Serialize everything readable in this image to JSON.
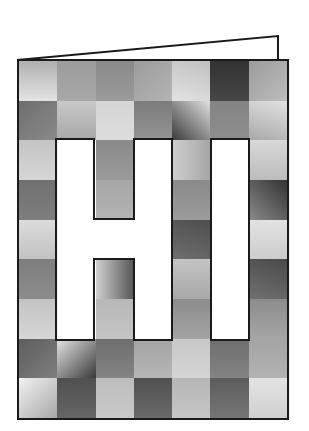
{
  "card": {
    "title": "HI",
    "letters": [
      "H",
      "I"
    ],
    "border_color": "#1a1a1a",
    "grid": {
      "columns": 7,
      "rows": 9
    },
    "tiles": [
      [
        [
          "#b0b0b0",
          "#e4e4e4",
          "180deg"
        ],
        [
          "#9c9c9c",
          "#a8a8a8",
          "180deg"
        ],
        [
          "#8a8a8a",
          "#9a9a9a",
          "180deg"
        ],
        [
          "#9c9c9c",
          "#b4b4b4",
          "135deg"
        ],
        [
          "#c0c0c0",
          "#e2e2e2",
          "200deg"
        ],
        [
          "#333333",
          "#474747",
          "180deg"
        ],
        [
          "#9c9c9c",
          "#bcbcbc",
          "135deg"
        ]
      ],
      [
        [
          "#6e6e6e",
          "#8a8a8a",
          "135deg"
        ],
        [
          "#c8c8c8",
          "#a8a8a8",
          "180deg"
        ],
        [
          "#d6d6d6",
          "#dcdcdc",
          "180deg"
        ],
        [
          "#7c7c7c",
          "#949494",
          "180deg"
        ],
        [
          "#3a3a3a",
          "#e0e0e0",
          "45deg"
        ],
        [
          "#848484",
          "#8e8e8e",
          "180deg"
        ],
        [
          "#e2e2e2",
          "#a8a8a8",
          "200deg"
        ]
      ],
      [
        [
          "#c4c4c4",
          "#d6d6d6",
          "180deg"
        ],
        null,
        [
          "#8a8a8a",
          "#9a9a9a",
          "180deg"
        ],
        null,
        [
          "#cfcfcf",
          "#a6a6a6",
          "90deg"
        ],
        null,
        [
          "#d8d8d8",
          "#bcbcbc",
          "180deg"
        ]
      ],
      [
        [
          "#707070",
          "#7e7e7e",
          "180deg"
        ],
        null,
        [
          "#a6a6a6",
          "#b4b4b4",
          "180deg"
        ],
        null,
        [
          "#8a8a8a",
          "#9c9c9c",
          "180deg"
        ],
        null,
        [
          "#333333",
          "#8a8a8a",
          "225deg"
        ]
      ],
      [
        [
          "#dcdcdc",
          "#c2c2c2",
          "180deg"
        ],
        null,
        null,
        null,
        [
          "#4e4e4e",
          "#6e6e6e",
          "200deg"
        ],
        null,
        [
          "#e2e2e2",
          "#cccccc",
          "180deg"
        ]
      ],
      [
        [
          "#7e7e7e",
          "#8c8c8c",
          "180deg"
        ],
        null,
        [
          "#d0d0d0",
          "#555555",
          "90deg"
        ],
        null,
        [
          "#c4c4c4",
          "#a8a8a8",
          "180deg"
        ],
        null,
        [
          "#4a4a4a",
          "#707070",
          "200deg"
        ]
      ],
      [
        [
          "#c4c4c4",
          "#d6d6d6",
          "180deg"
        ],
        null,
        [
          "#b8b8b8",
          "#c4c4c4",
          "180deg"
        ],
        null,
        [
          "#8c8c8c",
          "#a4a4a4",
          "180deg"
        ],
        null,
        [
          "#8c8c8c",
          "#a6a6a6",
          "180deg"
        ]
      ],
      [
        [
          "#5e5e5e",
          "#7e7e7e",
          "135deg"
        ],
        [
          "#e4e4e4",
          "#3a3a3a",
          "135deg"
        ],
        [
          "#6e6e6e",
          "#848484",
          "180deg"
        ],
        [
          "#a4a4a4",
          "#b6b6b6",
          "180deg"
        ],
        [
          "#c8c8c8",
          "#d4d4d4",
          "180deg"
        ],
        [
          "#6e6e6e",
          "#848484",
          "180deg"
        ],
        [
          "#a4a4a4",
          "#b2b2b2",
          "180deg"
        ]
      ],
      [
        [
          "#f2f2f2",
          "#a8a8a8",
          "135deg"
        ],
        [
          "#505050",
          "#666666",
          "180deg"
        ],
        [
          "#bcbcbc",
          "#cacaca",
          "180deg"
        ],
        [
          "#505050",
          "#6a6a6a",
          "180deg"
        ],
        [
          "#b6b6b6",
          "#c6c6c6",
          "180deg"
        ],
        [
          "#5c5c5c",
          "#767676",
          "180deg"
        ],
        [
          "#e4e4e4",
          "#d0d0d0",
          "180deg"
        ]
      ]
    ]
  },
  "flap": {
    "stroke": "#1a1a1a"
  }
}
